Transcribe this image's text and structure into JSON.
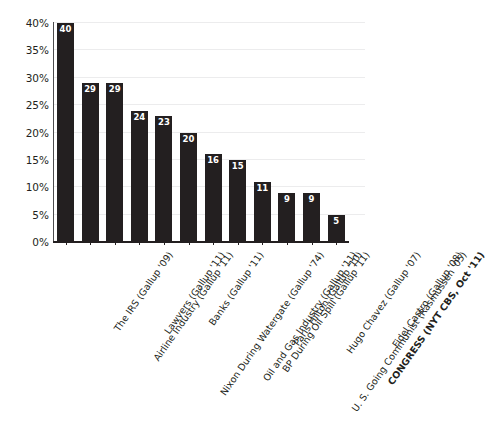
{
  "chart_data": {
    "type": "bar",
    "title": "",
    "xlabel": "",
    "ylabel": "",
    "ylim": [
      0,
      40
    ],
    "grid": true,
    "legend": null,
    "y_ticks": [
      "0%",
      "5%",
      "10%",
      "15%",
      "20%",
      "25%",
      "30%",
      "35%",
      "40%"
    ],
    "categories": [
      "The IRS (Gallup '09)",
      "Airline Industry (Gallup '11)",
      "Lawyers (Gallup '11)",
      "Nixon During Watergate (Gallup '74)",
      "Banks (Gallup '11)",
      "Oil and Gas Industry (Gallup '11)",
      "BP During Oil Spill (Gallup '11)",
      "Paris Hilton (Gallup '10)",
      "U. S. Going Communist (Rasmussen '05)",
      "Hugo Chavez (Gallup '07)",
      "CONGRESS (NYT CBS, Oct '11)",
      "Fidel Castro (Gallup '08)"
    ],
    "values": [
      40,
      29,
      29,
      24,
      23,
      20,
      16,
      15,
      11,
      9,
      9,
      5
    ],
    "value_labels": [
      "40",
      "29",
      "29",
      "24",
      "23",
      "20",
      "16",
      "15",
      "11",
      "9",
      "9",
      "5"
    ],
    "highlight_category": "CONGRESS (NYT CBS, Oct '11)",
    "bar_color": "#231f20",
    "value_label_color": "#ffffff",
    "gridline_color": "#ececed",
    "axis_color": "#231f20"
  },
  "clipped_header": {
    "text": ""
  }
}
